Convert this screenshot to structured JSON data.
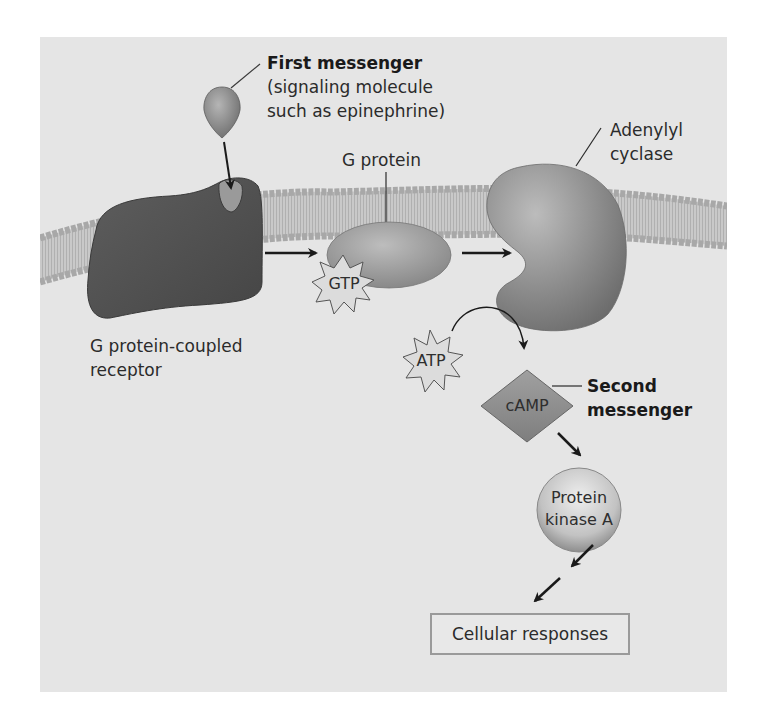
{
  "figure": {
    "type": "cell-signaling-pathway",
    "background": "#e5e5e5"
  },
  "labels": {
    "first_messenger": {
      "title": "First messenger",
      "line1": "(signaling molecule",
      "line2": "such as epinephrine)"
    },
    "g_protein": "G protein",
    "adenylyl_cyclase": {
      "line1": "Adenylyl",
      "line2": "cyclase"
    },
    "receptor": {
      "line1": "G protein-coupled",
      "line2": "receptor"
    },
    "second_messenger": {
      "line1": "Second",
      "line2": "messenger"
    }
  },
  "molecules": {
    "gtp": "GTP",
    "atp": "ATP",
    "camp": "cAMP",
    "protein_kinase_a": {
      "line1": "Protein",
      "line2": "kinase A"
    }
  },
  "outcome": {
    "cellular_responses": "Cellular responses"
  },
  "colors": {
    "membrane_head": "#a8a8a8",
    "membrane_tail": "#c4c4c4",
    "receptor": "#555555",
    "g_protein": "#9a9a9a",
    "adenylyl_cyclase": "#8a8a8a",
    "camp": "#8f8f8f",
    "kinase": "#bdbdbd",
    "arrow": "#1a1a1a"
  }
}
